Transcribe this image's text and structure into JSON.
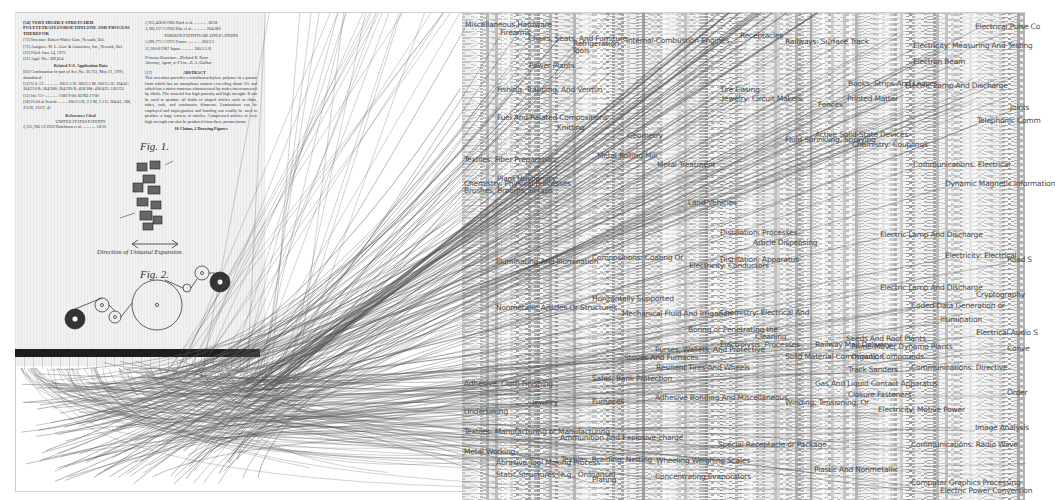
{
  "patent": {
    "header_left": [
      {
        "code": "[54]",
        "text": "VERY HIGHLY STRETCHED POLYTETRAFLUOROETHYLENE AND PROCESS THEREFOR"
      },
      {
        "code": "[75]",
        "text": "Inventor: Robert Walter Gore, Newark, Del."
      },
      {
        "code": "[73]",
        "text": "Assignee: W. L. Gore & Associates, Inc., Newark, Del."
      },
      {
        "code": "[22]",
        "text": "Filed: June 14, 1973"
      },
      {
        "code": "[21]",
        "text": "Appl. No.: 369,814"
      }
    ],
    "related_heading": "Related U.S. Application Data",
    "related": [
      {
        "code": "[63]",
        "text": "Continuation-in-part of Ser. No. 30,753, May 21, 1970, abandoned."
      },
      {
        "code": "[52]",
        "text": "U.S. Cl. ............ 260/2.5 R; 260/2.5 M; 260/2.5 E; 264/41; 264/210 R; 264/288; 264/290 R; 428/308; 428/422; 526/255"
      },
      {
        "code": "[51]",
        "text": "Int. Cl.² ............ C08J 9/00; B29D 27/00"
      },
      {
        "code": "[58]",
        "text": "Field of Search ......... 260/2.5 R, 2.5 M, 2.5 E; 264/41, 288, 210 R, 210 F, 41"
      }
    ],
    "references_heading": "References Cited",
    "us_patents_heading": "UNITED STATES PATENTS",
    "reference_row": "2,315,786  12/1959  Hutchison et al. ............ 18/55",
    "header_right": [
      "2,953,428   8/1960   Hurd et al. ............ 18/58",
      "3,180,137   1/1956   Pike et al. ............ 204/280"
    ],
    "foreign_heading": "FOREIGN PATENTS OR APPLICATIONS",
    "foreign": [
      "1,090,775   1/1972   France ............ 260/2.5",
      "12,300   8/1967   Japan ............ 260/2.5 R"
    ],
    "examiner": "Primary Examiner—Richard B. Turer",
    "attorney": "Attorney, Agent, or Firm—E. A. Gellner",
    "abstract_code": "[57]",
    "abstract_heading": "ABSTRACT",
    "abstract": "This invention provides a tetrafluoroethylene polymer in a porous form which has an amorphous content exceeding about 5% and which has a micro-structure characterized by nodes interconnected by fibrils. The material has high porosity and high strength. It can be used to produce all kinds of shaped articles such as films, tubes, rods, and continuous filaments. Laminations can be employed and impregnation and bonding can readily be used to produce a large variety of articles. Compressed articles of very high strength can also be produced from these porous forms.",
    "claims": "10 Claims, 2 Drawing Figures",
    "fig1_label": "Fig. 1.",
    "fig1_caption": "Direction of Uniaxial Expansion",
    "fig2_label": "Fig. 2.",
    "fig1_refs": [
      "12",
      "11",
      "12",
      "13",
      "10",
      "27",
      "21"
    ],
    "fig2_refs": [
      "14",
      "15",
      "16",
      "16",
      "17",
      "18",
      "19",
      "20",
      "22"
    ]
  },
  "categories": [
    {
      "label": "Miscellaneous Hardware",
      "x": 465,
      "y": 25
    },
    {
      "label": "Firearms",
      "x": 500,
      "y": 33
    },
    {
      "label": "Chairs, Seats, And Furniture",
      "x": 528,
      "y": 39
    },
    {
      "label": "Refrigeration",
      "x": 573,
      "y": 44
    },
    {
      "label": "Tools",
      "x": 572,
      "y": 51
    },
    {
      "label": "Internal-Combustion Engines",
      "x": 626,
      "y": 41
    },
    {
      "label": "Receptacles",
      "x": 740,
      "y": 36
    },
    {
      "label": "Railways: Surface Track",
      "x": 785,
      "y": 42
    },
    {
      "label": "Electrical Pulse Co",
      "x": 975,
      "y": 27
    },
    {
      "label": "Electricity: Measuring And Testing",
      "x": 913,
      "y": 46
    },
    {
      "label": "Electron Beam",
      "x": 913,
      "y": 62
    },
    {
      "label": "Power Plants",
      "x": 529,
      "y": 66
    },
    {
      "label": "Fishing, Trapping, And Vermin",
      "x": 497,
      "y": 90
    },
    {
      "label": "Tire Casing",
      "x": 720,
      "y": 90
    },
    {
      "label": "Jewelry: Circuit Makers",
      "x": 722,
      "y": 99
    },
    {
      "label": "Books, Strips And Leaves",
      "x": 848,
      "y": 84
    },
    {
      "label": "Electric Lamp And Discharge",
      "x": 905,
      "y": 86
    },
    {
      "label": "Printed Matter",
      "x": 847,
      "y": 99
    },
    {
      "label": "Fences",
      "x": 818,
      "y": 105
    },
    {
      "label": "Fuel And Related Compositions",
      "x": 497,
      "y": 118
    },
    {
      "label": "Joints",
      "x": 1010,
      "y": 108
    },
    {
      "label": "Telephonic Comm",
      "x": 977,
      "y": 121
    },
    {
      "label": "Knitting",
      "x": 557,
      "y": 128
    },
    {
      "label": "Geometry",
      "x": 627,
      "y": 136
    },
    {
      "label": "Active Solid-State Devices",
      "x": 815,
      "y": 135
    },
    {
      "label": "Fluid Sprinkling, Spraying",
      "x": 785,
      "y": 140
    },
    {
      "label": "Chemistry: Couplings",
      "x": 852,
      "y": 145
    },
    {
      "label": "Textiles: Fiber Preparation",
      "x": 464,
      "y": 160
    },
    {
      "label": "Metal Rolling Mill",
      "x": 597,
      "y": 156
    },
    {
      "label": "Metal Treatment",
      "x": 657,
      "y": 165
    },
    {
      "label": "Communications: Electrical",
      "x": 913,
      "y": 165
    },
    {
      "label": "Plant Husbandry",
      "x": 497,
      "y": 179
    },
    {
      "label": "Chemistry: Physical Processes",
      "x": 464,
      "y": 184
    },
    {
      "label": "Brushes, Brooms, Scraps",
      "x": 464,
      "y": 191
    },
    {
      "label": "Dynamic Magnetic Information",
      "x": 945,
      "y": 184
    },
    {
      "label": "Land Vehicles",
      "x": 688,
      "y": 203
    },
    {
      "label": "Distillation: Processes",
      "x": 720,
      "y": 233
    },
    {
      "label": "Article Dispensing",
      "x": 753,
      "y": 243
    },
    {
      "label": "Electric Lamp And Discharge",
      "x": 880,
      "y": 235
    },
    {
      "label": "Electricity: Electrical",
      "x": 945,
      "y": 256
    },
    {
      "label": "Road S",
      "x": 1007,
      "y": 260
    },
    {
      "label": "Illuminating And Illumination",
      "x": 496,
      "y": 262
    },
    {
      "label": "Compositions: Coating Or",
      "x": 592,
      "y": 258
    },
    {
      "label": "Distillation: Apparatus",
      "x": 720,
      "y": 260
    },
    {
      "label": "Electricity: Conductors",
      "x": 689,
      "y": 266
    },
    {
      "label": "Electric Lamp And Discharge",
      "x": 880,
      "y": 288
    },
    {
      "label": "Cryptography",
      "x": 976,
      "y": 295
    },
    {
      "label": "Coded Data Generation or",
      "x": 911,
      "y": 306
    },
    {
      "label": "Horizontally Supported",
      "x": 592,
      "y": 299
    },
    {
      "label": "Nonmetallic Articles Or Structures",
      "x": 496,
      "y": 308
    },
    {
      "label": "Mechanical Fluid And Irrigation",
      "x": 622,
      "y": 314
    },
    {
      "label": "Chemistry: Electrical And",
      "x": 720,
      "y": 313
    },
    {
      "label": "Electrical Audio S",
      "x": 976,
      "y": 333
    },
    {
      "label": "Boring or Penetrating the",
      "x": 688,
      "y": 330
    },
    {
      "label": "Cleaning",
      "x": 755,
      "y": 337
    },
    {
      "label": "Illumination",
      "x": 940,
      "y": 320
    },
    {
      "label": "Seeds And Roof Plants",
      "x": 846,
      "y": 339
    },
    {
      "label": "Railway Mail Delivery",
      "x": 815,
      "y": 345
    },
    {
      "label": "Prime-Mover Dynamo Plants",
      "x": 851,
      "y": 347
    },
    {
      "label": "Conve",
      "x": 1007,
      "y": 349
    },
    {
      "label": "Electrolysis: Processes",
      "x": 720,
      "y": 345
    },
    {
      "label": "Purses, Wallets, And Protective",
      "x": 655,
      "y": 350
    },
    {
      "label": "Solid Material Comminution",
      "x": 785,
      "y": 357
    },
    {
      "label": "Organic Compounds",
      "x": 851,
      "y": 357
    },
    {
      "label": "Stoves And Furnaces",
      "x": 624,
      "y": 358
    },
    {
      "label": "Communications: Directive",
      "x": 911,
      "y": 368
    },
    {
      "label": "Track Sanders",
      "x": 848,
      "y": 370
    },
    {
      "label": "Resilient Tires And Wheels",
      "x": 656,
      "y": 368
    },
    {
      "label": "Adhesive, Cloth Finishing",
      "x": 464,
      "y": 384
    },
    {
      "label": "Safes, Bank Protection",
      "x": 592,
      "y": 379
    },
    {
      "label": "Gas And Liquid Contact Apparatus",
      "x": 815,
      "y": 384
    },
    {
      "label": "Closure Fasteners",
      "x": 848,
      "y": 395
    },
    {
      "label": "Order",
      "x": 1007,
      "y": 393
    },
    {
      "label": "Jewelry",
      "x": 532,
      "y": 403
    },
    {
      "label": "Furnaces",
      "x": 592,
      "y": 402
    },
    {
      "label": "Adhesive Bonding And Miscellaneous",
      "x": 655,
      "y": 398
    },
    {
      "label": "Winding, Tensioning, Or",
      "x": 785,
      "y": 403
    },
    {
      "label": "Electricity: Motive Power",
      "x": 878,
      "y": 410
    },
    {
      "label": "Undertaking",
      "x": 464,
      "y": 412
    },
    {
      "label": "Textiles: Manufacturing or Manufacturing",
      "x": 464,
      "y": 432
    },
    {
      "label": "Ammunition And Explosive-charge",
      "x": 560,
      "y": 438
    },
    {
      "label": "Image Analysis",
      "x": 975,
      "y": 428
    },
    {
      "label": "Special Receptacle or Package",
      "x": 718,
      "y": 445
    },
    {
      "label": "Communications: Radio Wave",
      "x": 911,
      "y": 445
    },
    {
      "label": "Metal Working",
      "x": 464,
      "y": 452
    },
    {
      "label": "Abrasive Tool Making Process",
      "x": 496,
      "y": 463
    },
    {
      "label": "Textiles: Braiding, Netting",
      "x": 561,
      "y": 460
    },
    {
      "label": "Wheeling Weighing Scales",
      "x": 656,
      "y": 461
    },
    {
      "label": "Plastic And Nonmetallic",
      "x": 814,
      "y": 470
    },
    {
      "label": "Static Structures (e.g., Ordnance)",
      "x": 496,
      "y": 475
    },
    {
      "label": "Plating",
      "x": 592,
      "y": 480
    },
    {
      "label": "Concentrating Evaporators",
      "x": 655,
      "y": 477
    },
    {
      "label": "Computer Graphics Processing",
      "x": 911,
      "y": 483
    },
    {
      "label": "Electric Power Conversion",
      "x": 940,
      "y": 491
    }
  ],
  "colors": {
    "background": "#ffffff",
    "mosaic": "#e4e4e4",
    "lines": "#555555",
    "label": "#4a4a4a",
    "bar": "#1e1e1e"
  }
}
